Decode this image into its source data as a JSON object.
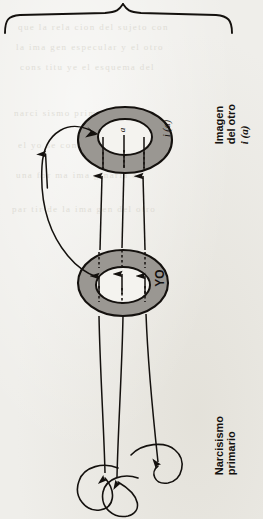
{
  "diagram": {
    "page_background": "#efeeea",
    "ink_color": "#14110e",
    "torus_fill": "#9a9792",
    "torus_stroke": "#14110e",
    "labels": {
      "imagen_del_otro": "Imagen\ndel otro\ni (a)",
      "imagen_del_otro_line1": "Imagen",
      "imagen_del_otro_line2": "del otro",
      "imagen_del_otro_line3": "i (a)",
      "narcisismo": "Narcisismo\nprimario",
      "narcisismo_line1": "Narcisismo",
      "narcisismo_line2": "primario",
      "yo": "YO",
      "i_de_a": "i (a)",
      "objeto_a": "a"
    },
    "shapes": {
      "top_brace": "horizontal-curly-brace",
      "upper_torus": "Imagen del otro i (a)",
      "lower_torus": "YO",
      "bottom_loops_count": 3,
      "vertical_arrows_count": 3,
      "feedback_arrow": "curved-arrow-left"
    }
  },
  "bleed_text": {
    "lines": [
      "que la rela cion del sujeto con",
      "la ima gen especular y el otro",
      "cons titu ye el esquema del",
      "narci sismo prima rio en que",
      "el yo se consti tuye como",
      "una for ma ima ginaria a",
      "par tir de la ima gen del otro"
    ]
  }
}
